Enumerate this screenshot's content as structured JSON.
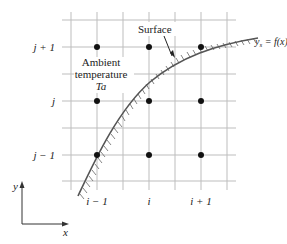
{
  "diagram": {
    "type": "finite-difference grid with curved boundary",
    "grid": {
      "vertical_lines_x": [
        71,
        97,
        123,
        149,
        175,
        201,
        227
      ],
      "horizontal_lines_y": [
        20,
        47,
        74,
        101,
        128,
        155,
        181
      ],
      "line_color": "#b8b8b8"
    },
    "nodes": [
      {
        "i": "i-1",
        "j": "j+1",
        "x": 97,
        "y": 47
      },
      {
        "i": "i",
        "j": "j+1",
        "x": 149,
        "y": 47
      },
      {
        "i": "i+1",
        "j": "j+1",
        "x": 201,
        "y": 47
      },
      {
        "i": "i-1",
        "j": "j",
        "x": 97,
        "y": 101
      },
      {
        "i": "i",
        "j": "j",
        "x": 149,
        "y": 101
      },
      {
        "i": "i+1",
        "j": "j",
        "x": 201,
        "y": 101
      },
      {
        "i": "i-1",
        "j": "j-1",
        "x": 97,
        "y": 155
      },
      {
        "i": "i",
        "j": "j-1",
        "x": 149,
        "y": 155
      },
      {
        "i": "i+1",
        "j": "j-1",
        "x": 201,
        "y": 155
      }
    ],
    "row_labels": {
      "top": "j + 1",
      "middle": "j",
      "bottom": "j − 1"
    },
    "column_labels": {
      "left": "i − 1",
      "middle": "i",
      "right": "i + 1"
    },
    "annotations": {
      "surface": "Surface",
      "ambient_line1": "Ambient",
      "ambient_line2": "temperature",
      "ambient_symbol": "Ta",
      "curve_eq_lhs": "y",
      "curve_eq_sub": "s",
      "curve_eq_rhs": " = f(x)"
    },
    "axes": {
      "x_label": "x",
      "y_label": "y"
    }
  }
}
